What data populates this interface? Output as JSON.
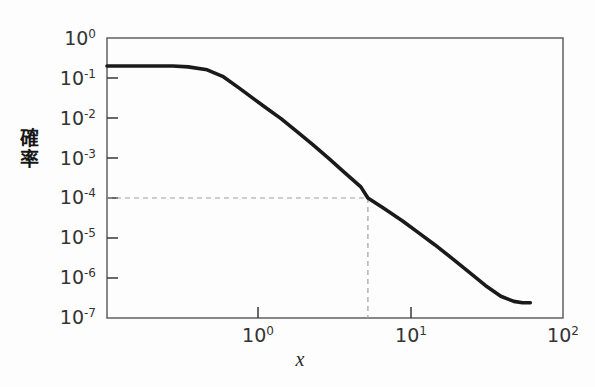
{
  "figure": {
    "background_color": "#fdfdfd",
    "curve_color": "#1a1a1a",
    "axis_color": "#555555",
    "dashed_color": "#9a9a9a"
  },
  "axes": {
    "x_label": "x",
    "y_label_chars": [
      "確",
      "率"
    ],
    "y_label": "確率",
    "x_ticks": [
      {
        "label_mantissa": "10",
        "label_exponent": "0",
        "value": 1
      },
      {
        "label_mantissa": "10",
        "label_exponent": "1",
        "value": 10
      },
      {
        "label_mantissa": "10",
        "label_exponent": "2",
        "value": 100
      }
    ],
    "y_ticks": [
      {
        "label_mantissa": "10",
        "label_exponent": "0",
        "value": 1
      },
      {
        "label_mantissa": "10",
        "label_exponent": "-1",
        "value": 0.1
      },
      {
        "label_mantissa": "10",
        "label_exponent": "-2",
        "value": 0.01
      },
      {
        "label_mantissa": "10",
        "label_exponent": "-3",
        "value": 0.001
      },
      {
        "label_mantissa": "10",
        "label_exponent": "-4",
        "value": 0.0001
      },
      {
        "label_mantissa": "10",
        "label_exponent": "-5",
        "value": 1e-05
      },
      {
        "label_mantissa": "10",
        "label_exponent": "-6",
        "value": 1e-06
      },
      {
        "label_mantissa": "10",
        "label_exponent": "-7",
        "value": 1e-07
      }
    ]
  },
  "chart_data": {
    "type": "line",
    "title": "",
    "xlabel": "x",
    "ylabel": "確率",
    "xscale": "log",
    "yscale": "log",
    "xlim": [
      0.46,
      100
    ],
    "ylim": [
      1e-07,
      1
    ],
    "grid": false,
    "legend": false,
    "series": [
      {
        "name": "probability",
        "x": [
          0.46,
          0.6,
          0.8,
          1.0,
          1.2,
          1.5,
          1.8,
          2.2,
          2.6,
          3.0,
          3.6,
          4.3,
          5.2,
          6.3,
          7.6,
          9.2,
          10.0,
          12.0,
          15.0,
          18.0,
          22.0,
          27.0,
          33.0,
          40.0,
          48.0,
          56.0,
          62.0,
          68.0
        ],
        "y": [
          0.2,
          0.2,
          0.2,
          0.2,
          0.19,
          0.16,
          0.11,
          0.055,
          0.03,
          0.018,
          0.0095,
          0.0047,
          0.0022,
          0.00098,
          0.00043,
          0.00019,
          0.0001,
          5.6e-05,
          2.7e-05,
          1.4e-05,
          6.8e-06,
          3.1e-06,
          1.4e-06,
          6.5e-07,
          3.5e-07,
          2.6e-07,
          2.4e-07,
          2.4e-07
        ]
      }
    ],
    "annotations": [
      {
        "type": "dashed-guide",
        "description": "dashed reference lines marking the point x = 10, probability = 1e-4",
        "x": 10,
        "y": 0.0001
      }
    ]
  }
}
